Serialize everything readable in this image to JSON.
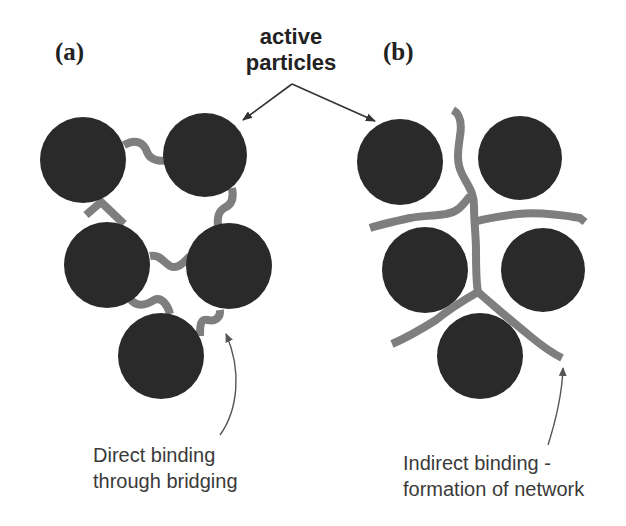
{
  "figure": {
    "panel_a": {
      "label": "(a)",
      "caption_line1": "Direct binding",
      "caption_line2": "through bridging",
      "particles": [
        {
          "cx": 83,
          "cy": 160,
          "r": 43
        },
        {
          "cx": 205,
          "cy": 155,
          "r": 42
        },
        {
          "cx": 107,
          "cy": 265,
          "r": 43
        },
        {
          "cx": 229,
          "cy": 266,
          "r": 43
        },
        {
          "cx": 161,
          "cy": 356,
          "r": 43
        }
      ]
    },
    "panel_b": {
      "label": "(b)",
      "caption_line1": "Indirect binding -",
      "caption_line2": "formation of network",
      "particles": [
        {
          "cx": 400,
          "cy": 162,
          "r": 43
        },
        {
          "cx": 520,
          "cy": 158,
          "r": 42
        },
        {
          "cx": 425,
          "cy": 270,
          "r": 43
        },
        {
          "cx": 543,
          "cy": 270,
          "r": 42
        },
        {
          "cx": 480,
          "cy": 356,
          "r": 43
        }
      ]
    },
    "callout": {
      "line1": "active",
      "line2": "particles"
    },
    "colors": {
      "particle": "#2a2a2a",
      "binder": "#7e7e7e",
      "text": "#222222",
      "caption": "#3a3a3a",
      "background": "#ffffff"
    }
  }
}
